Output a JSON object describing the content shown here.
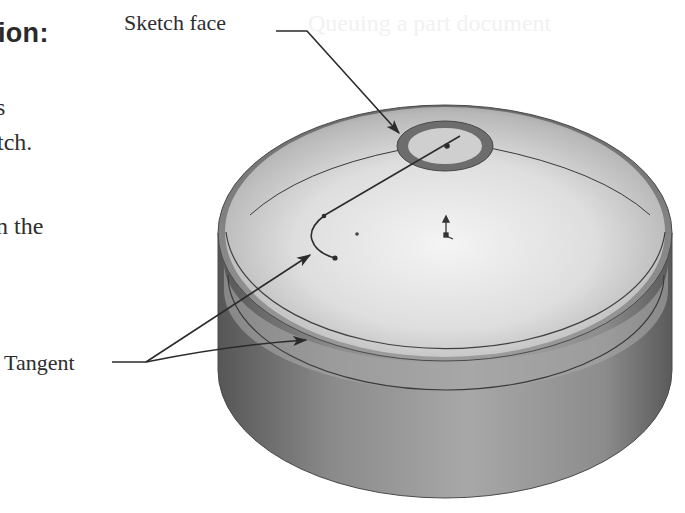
{
  "page": {
    "heading_fragment": "ion:",
    "body_fragments": [
      "s",
      "tch.",
      "n the"
    ],
    "bleed_through_text": "Queuing a part document"
  },
  "figure": {
    "callouts": {
      "sketch_face": "Sketch face",
      "tangent": "Tangent"
    },
    "colors": {
      "text": "#2e2e2e",
      "dome_light": "#f0f0f0",
      "side_dark": "#5e5e5e",
      "side_mid": "#9a9a9a",
      "edge": "#3a3a3a"
    }
  }
}
